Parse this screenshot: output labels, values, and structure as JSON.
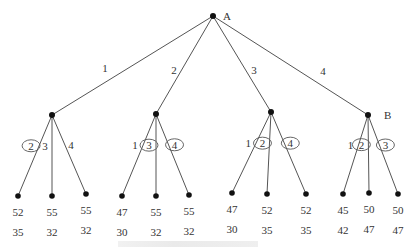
{
  "root": {
    "label": "A",
    "x": 213,
    "y": 16
  },
  "level1": [
    {
      "edge_label": "1",
      "x": 52,
      "y": 115,
      "edge_label_pos": [
        105,
        72
      ]
    },
    {
      "edge_label": "2",
      "x": 156,
      "y": 114,
      "edge_label_pos": [
        174,
        74
      ]
    },
    {
      "edge_label": "3",
      "x": 271,
      "y": 112,
      "edge_label_pos": [
        254,
        74
      ]
    },
    {
      "edge_label": "4",
      "x": 368,
      "y": 115,
      "edge_label_pos": [
        323,
        75
      ],
      "node_label": "B"
    }
  ],
  "leaves": [
    {
      "parent": 0,
      "edge_label": "2",
      "circled": true,
      "x": 18,
      "y": 196,
      "v1": "52",
      "v2": "35"
    },
    {
      "parent": 0,
      "edge_label": "3",
      "circled": false,
      "x": 52,
      "y": 196,
      "v1": "55",
      "v2": "32"
    },
    {
      "parent": 0,
      "edge_label": "4",
      "circled": false,
      "x": 86,
      "y": 194,
      "v1": "55",
      "v2": "32"
    },
    {
      "parent": 1,
      "edge_label": "1",
      "circled": false,
      "x": 122,
      "y": 196,
      "v1": "47",
      "v2": "30"
    },
    {
      "parent": 1,
      "edge_label": "3",
      "circled": true,
      "x": 156,
      "y": 196,
      "v1": "55",
      "v2": "32"
    },
    {
      "parent": 1,
      "edge_label": "4",
      "circled": true,
      "x": 189,
      "y": 195,
      "v1": "55",
      "v2": "32"
    },
    {
      "parent": 2,
      "edge_label": "1",
      "circled": false,
      "x": 232,
      "y": 193,
      "v1": "47",
      "v2": "30"
    },
    {
      "parent": 2,
      "edge_label": "2",
      "circled": true,
      "x": 267,
      "y": 194,
      "v1": "52",
      "v2": "35"
    },
    {
      "parent": 2,
      "edge_label": "4",
      "circled": true,
      "x": 306,
      "y": 194,
      "v1": "52",
      "v2": "35"
    },
    {
      "parent": 3,
      "edge_label": "1",
      "circled": false,
      "x": 343,
      "y": 194,
      "v1": "45",
      "v2": "42"
    },
    {
      "parent": 3,
      "edge_label": "2",
      "circled": true,
      "x": 369,
      "y": 193,
      "v1": "50",
      "v2": "47"
    },
    {
      "parent": 3,
      "edge_label": "3",
      "circled": true,
      "x": 398,
      "y": 194,
      "v1": "50",
      "v2": "47"
    }
  ],
  "colors": {
    "line": "#555555",
    "node": "#111111",
    "text": "#333333"
  }
}
